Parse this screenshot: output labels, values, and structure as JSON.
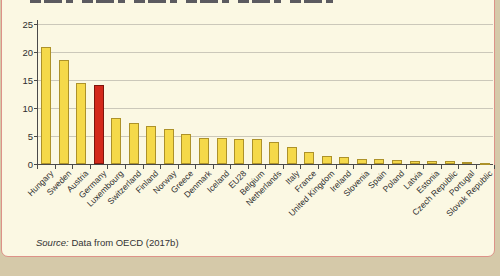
{
  "figure": {
    "source_prefix": "Source:",
    "source_text": " Data from OECD (2017b)"
  },
  "chart_data": {
    "type": "bar",
    "title": "",
    "xlabel": "",
    "ylabel": "",
    "ylim": [
      0,
      25
    ],
    "yticks": [
      0,
      5,
      10,
      15,
      20,
      25
    ],
    "grid": true,
    "legend": false,
    "categories": [
      "Hungary",
      "Sweden",
      "Austria",
      "Germany",
      "Luxembourg",
      "Switzerland",
      "Finland",
      "Norway",
      "Greece",
      "Denmark",
      "Iceland",
      "EU28",
      "Belgium",
      "Netherlands",
      "Italy",
      "France",
      "United Kingdom",
      "Ireland",
      "Slovenia",
      "Spain",
      "Poland",
      "Latvia",
      "Estonia",
      "Czech Republic",
      "Portugal",
      "Slovak Republic"
    ],
    "values": [
      20.9,
      18.6,
      14.5,
      14.1,
      8.2,
      7.3,
      6.7,
      6.3,
      5.4,
      4.7,
      4.7,
      4.5,
      4.5,
      4.0,
      3.1,
      2.2,
      1.4,
      1.3,
      0.9,
      0.85,
      0.75,
      0.6,
      0.5,
      0.45,
      0.35,
      0.15
    ],
    "highlight": {
      "category": "Germany",
      "index": 3
    },
    "colors": {
      "bar_fill": "#F5D94A",
      "bar_border": "#AD922A",
      "highlight_fill": "#D3291B",
      "highlight_border": "#7E150C",
      "gridline": "#CBC8BA",
      "axis": "#4A4A4A",
      "panel_bg": "#FBF8E3",
      "panel_border": "#DD9288",
      "page_bg": "#D5C9A9",
      "text": "#2E2E2E"
    }
  }
}
